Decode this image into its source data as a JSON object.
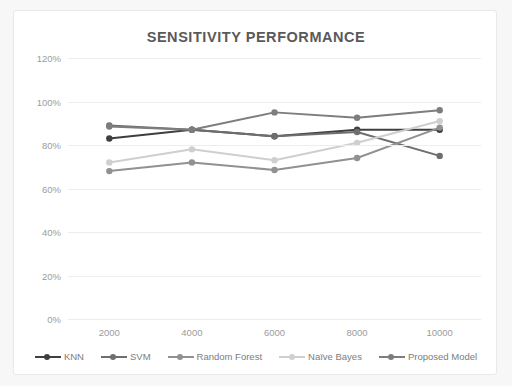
{
  "card": {
    "background": "#ffffff",
    "border_color": "#e9e9e9"
  },
  "chart_data": {
    "type": "line",
    "title": "SENSITIVITY PERFORMANCE",
    "xlabel": "",
    "ylabel": "",
    "categories": [
      "2000",
      "4000",
      "6000",
      "8000",
      "10000"
    ],
    "x": [
      2000,
      4000,
      6000,
      8000,
      10000
    ],
    "ylim": [
      0,
      120
    ],
    "yticks": [
      0,
      20,
      40,
      60,
      80,
      100,
      120
    ],
    "ytick_labels": [
      "0%",
      "20%",
      "40%",
      "60%",
      "80%",
      "100%",
      "120%"
    ],
    "grid": true,
    "legend_position": "bottom",
    "series": [
      {
        "name": "KNN",
        "color": "#3f3f3f",
        "values": [
          83,
          87,
          84,
          87,
          87
        ]
      },
      {
        "name": "SVM",
        "color": "#6e6e6e",
        "values": [
          89,
          87,
          84,
          86,
          75
        ]
      },
      {
        "name": "Random Forest",
        "color": "#919191",
        "values": [
          68,
          72,
          68.5,
          74,
          88
        ]
      },
      {
        "name": "Naïve Bayes",
        "color": "#cfcfcf",
        "values": [
          72,
          78,
          73,
          81,
          91
        ]
      },
      {
        "name": "Proposed Model",
        "color": "#7d7d7d",
        "values": [
          88.5,
          87,
          95,
          92.5,
          96
        ]
      }
    ]
  }
}
